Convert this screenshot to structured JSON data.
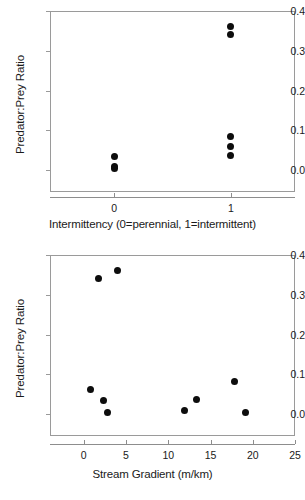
{
  "figure": {
    "panels": [
      {
        "id": "panel-a",
        "y_axis_label": "Predator:Prey Ratio",
        "x_axis_label": "Intermittency (0=perennial, 1=intermittent)",
        "y_ticks": [
          "0.4",
          "0.3",
          "0.2",
          "0.1",
          "0.0"
        ],
        "x_ticks": [
          "0",
          "1"
        ]
      },
      {
        "id": "panel-b",
        "y_axis_label": "Predator:Prey Ratio",
        "x_axis_label": "Stream Gradient (m/km)",
        "y_ticks": [
          "0.4",
          "0.3",
          "0.2",
          "0.1",
          "0.0"
        ],
        "x_ticks": [
          "0",
          "5",
          "10",
          "15",
          "20",
          "25"
        ]
      }
    ]
  },
  "chart_data": [
    {
      "type": "scatter",
      "title": "",
      "xlabel": "Intermittency (0=perennial, 1=intermittent)",
      "ylabel": "Predator:Prey Ratio",
      "xlim": [
        -0.55,
        1.55
      ],
      "ylim": [
        -0.055,
        0.4
      ],
      "xticks": [
        0,
        1
      ],
      "xticklabels": [
        "0",
        "1"
      ],
      "yticks": [
        0.0,
        0.1,
        0.2,
        0.3,
        0.4
      ],
      "yticklabels": [
        "0.0",
        "0.1",
        "0.2",
        "0.3",
        "0.4"
      ],
      "grid": false,
      "legend": "none",
      "marker": "filled-circle",
      "marker_color": "#0d0d0d",
      "points": [
        {
          "x": 0,
          "y": 0.033
        },
        {
          "x": 0,
          "y": 0.008
        },
        {
          "x": 0,
          "y": 0.004
        },
        {
          "x": 1,
          "y": 0.36
        },
        {
          "x": 1,
          "y": 0.34
        },
        {
          "x": 1,
          "y": 0.084
        },
        {
          "x": 1,
          "y": 0.059
        },
        {
          "x": 1,
          "y": 0.038
        }
      ]
    },
    {
      "type": "scatter",
      "title": "",
      "xlabel": "Stream Gradient (m/km)",
      "ylabel": "Predator:Prey Ratio",
      "xlim": [
        -4.0,
        25.0
      ],
      "ylim": [
        -0.055,
        0.4
      ],
      "xticks": [
        0,
        5,
        10,
        15,
        20,
        25
      ],
      "xticklabels": [
        "0",
        "5",
        "10",
        "15",
        "20",
        "25"
      ],
      "yticks": [
        0.0,
        0.1,
        0.2,
        0.3,
        0.4
      ],
      "yticklabels": [
        "0.0",
        "0.1",
        "0.2",
        "0.3",
        "0.4"
      ],
      "grid": false,
      "legend": "none",
      "marker": "filled-circle",
      "marker_color": "#0d0d0d",
      "points": [
        {
          "x": 1.7,
          "y": 0.34
        },
        {
          "x": 4.0,
          "y": 0.36
        },
        {
          "x": 0.8,
          "y": 0.061
        },
        {
          "x": 2.3,
          "y": 0.034
        },
        {
          "x": 2.8,
          "y": 0.004
        },
        {
          "x": 11.9,
          "y": 0.008
        },
        {
          "x": 13.3,
          "y": 0.038
        },
        {
          "x": 17.8,
          "y": 0.083
        },
        {
          "x": 19.1,
          "y": 0.005
        }
      ]
    }
  ]
}
